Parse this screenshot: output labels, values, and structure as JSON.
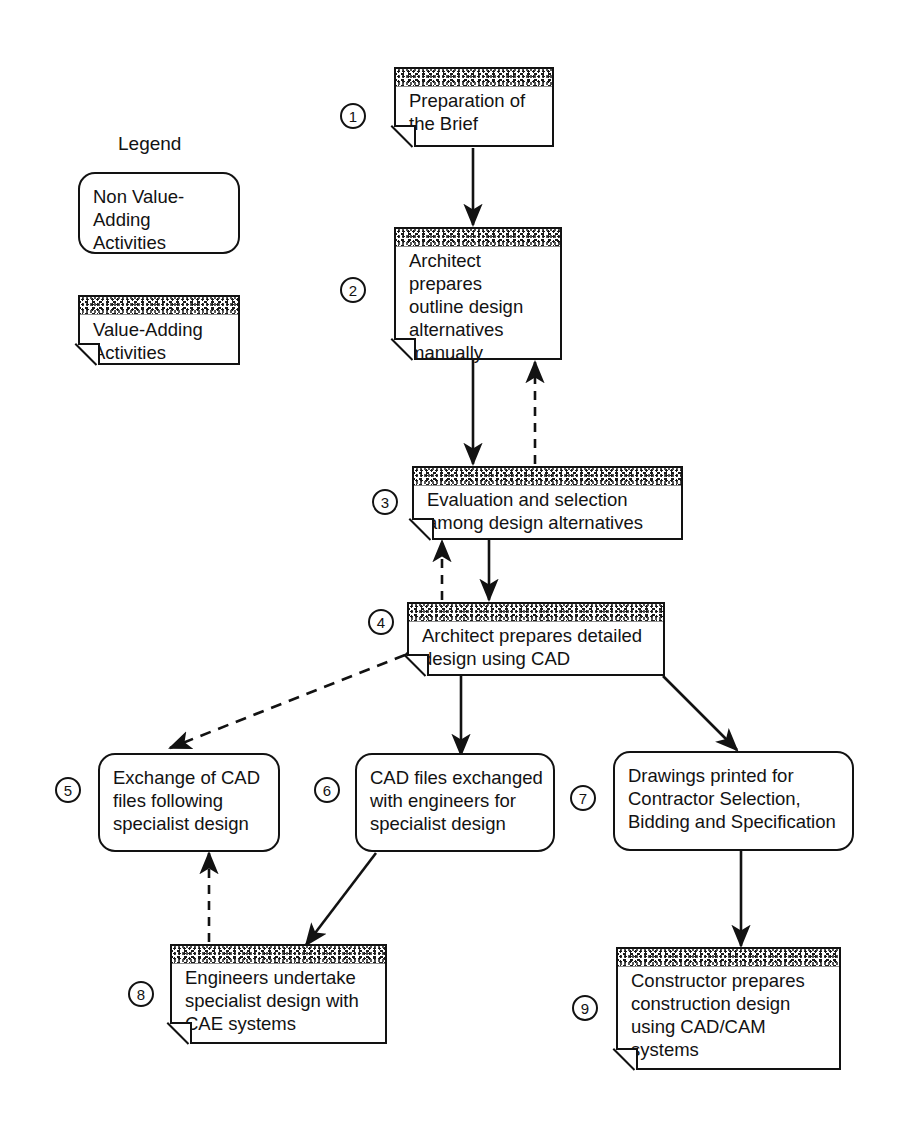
{
  "diagram": {
    "title_text": "Legend",
    "legend": {
      "non_value_label": "Non Value-\nAdding\nActivities",
      "value_label": "Value-Adding\nActivities"
    },
    "nodes": [
      {
        "number": "1",
        "text": "Preparation of\nthe Brief",
        "type": "value-adding"
      },
      {
        "number": "2",
        "text": "Architect prepares\noutline design\nalternatives\nmanually",
        "type": "value-adding"
      },
      {
        "number": "3",
        "text": "Evaluation and selection\namong design alternatives",
        "type": "value-adding"
      },
      {
        "number": "4",
        "text": "Architect prepares detailed\ndesign using CAD",
        "type": "value-adding"
      },
      {
        "number": "5",
        "text": "Exchange of CAD\nfiles following\nspecialist design",
        "type": "non-value-adding"
      },
      {
        "number": "6",
        "text": "CAD files exchanged\nwith engineers for\nspecialist design",
        "type": "non-value-adding"
      },
      {
        "number": "7",
        "text": "Drawings printed for\nContractor Selection,\nBidding and Specification",
        "type": "non-value-adding"
      },
      {
        "number": "8",
        "text": "Engineers undertake\nspecialist design with\nCAE systems",
        "type": "value-adding"
      },
      {
        "number": "9",
        "text": "Constructor prepares\nconstruction design\nusing CAD/CAM\nsystems",
        "type": "value-adding"
      }
    ],
    "edges": [
      {
        "from": "1",
        "to": "2",
        "style": "solid"
      },
      {
        "from": "2",
        "to": "3",
        "style": "solid"
      },
      {
        "from": "3",
        "to": "2",
        "style": "dashed"
      },
      {
        "from": "3",
        "to": "4",
        "style": "solid"
      },
      {
        "from": "4",
        "to": "3",
        "style": "dashed"
      },
      {
        "from": "4",
        "to": "5",
        "style": "dashed"
      },
      {
        "from": "5",
        "to": "4",
        "style": "dashed"
      },
      {
        "from": "4",
        "to": "6",
        "style": "solid"
      },
      {
        "from": "4",
        "to": "7",
        "style": "solid"
      },
      {
        "from": "6",
        "to": "8",
        "style": "solid"
      },
      {
        "from": "8",
        "to": "5",
        "style": "dashed"
      },
      {
        "from": "7",
        "to": "9",
        "style": "solid"
      }
    ],
    "colors": {
      "ink": "#121212",
      "background": "#ffffff"
    }
  }
}
